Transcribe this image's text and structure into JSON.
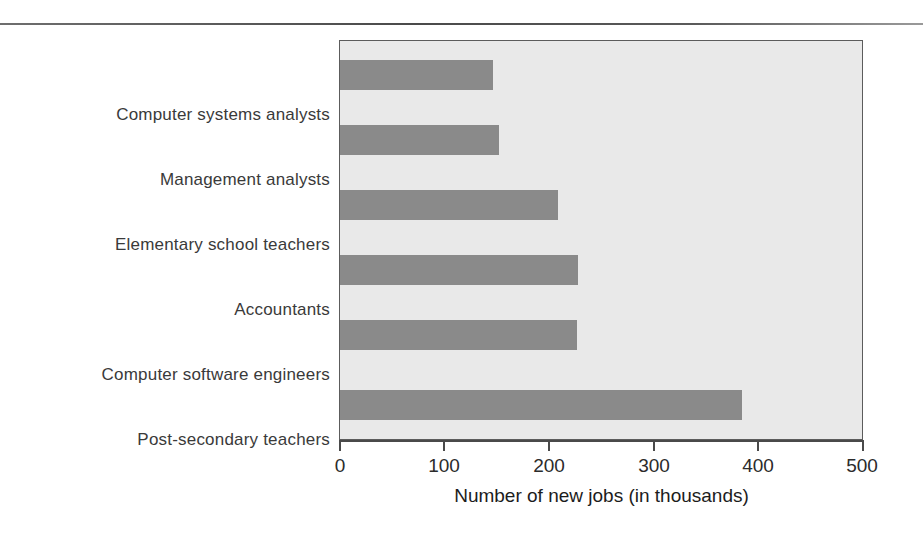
{
  "figure": {
    "background_color": "#ffffff",
    "plot_background_color": "#e9e9e9",
    "bar_color": "#8a8a8a",
    "axis_color": "#4a4a4a"
  },
  "chart_data": {
    "type": "bar",
    "orientation": "horizontal",
    "title": "",
    "subtitle": "",
    "xlabel": "Number of new jobs (in thousands)",
    "ylabel": "",
    "categories": [
      "Computer systems analysts",
      "Management analysts",
      "Elementary school teachers",
      "Accountants",
      "Computer software engineers",
      "Post-secondary teachers"
    ],
    "values": [
      147,
      152,
      209,
      228,
      227,
      385
    ],
    "xlim": [
      0,
      500
    ],
    "xticks": [
      0,
      100,
      200,
      300,
      400,
      500
    ],
    "xtick_labels": [
      "0",
      "100",
      "200",
      "300",
      "400",
      "500"
    ],
    "grid": false,
    "legend": false,
    "legend_position": "none"
  }
}
